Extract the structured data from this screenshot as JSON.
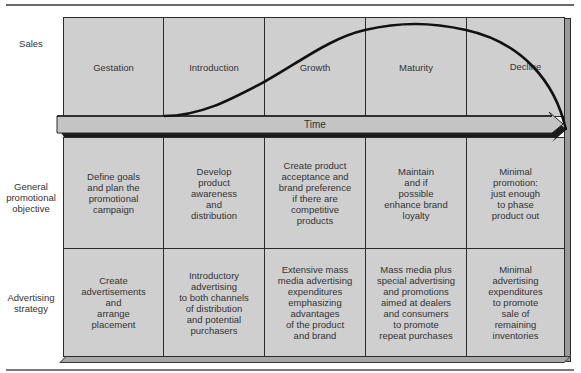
{
  "diagram": {
    "row_labels": {
      "sales": "Sales",
      "objective": "General\npromotional\nobjective",
      "strategy": "Advertising\nstrategy"
    },
    "axis": {
      "time_label": "Time"
    },
    "stages": [
      {
        "name": "Gestation",
        "objective": "Define goals\nand plan the\npromotional\ncampaign",
        "strategy": "Create\nadvertisements\nand\narrange\nplacement"
      },
      {
        "name": "Introduction",
        "objective": "Develop\nproduct\nawareness\nand\ndistribution",
        "strategy": "Introductory\nadvertising\nto both channels\nof distribution\nand potential\npurchasers"
      },
      {
        "name": "Growth",
        "objective": "Create product\nacceptance and\nbrand preference\nif there are\ncompetitive\nproducts",
        "strategy": "Extensive mass\nmedia advertising\nexpenditures\nemphasizing\nadvantages\nof the product\nand brand"
      },
      {
        "name": "Maturity",
        "objective": "Maintain\nand if\npossible\nenhance brand\nloyalty",
        "strategy": "Mass media plus\nspecial advertising\nand promotions\naimed at dealers\nand consumers\nto promote\nrepeat purchases"
      },
      {
        "name": "Decline",
        "objective": "Minimal\npromotion:\njust enough\nto phase\nproduct out",
        "strategy": "Minimal\nadvertising\nexpenditures\nto promote\nsale of\nremaining\ninventories"
      }
    ],
    "colors": {
      "cell_fill": "#cfcfcf",
      "line": "#2b2b2b",
      "curve": "#111111"
    }
  }
}
